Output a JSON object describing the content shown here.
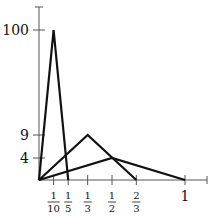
{
  "chart_data": {
    "type": "line",
    "title": "",
    "xlabel": "",
    "ylabel": "",
    "grid": false,
    "legend": "none",
    "x_ticks": [
      {
        "value": 0.1,
        "num": "1",
        "den": "10"
      },
      {
        "value": 0.2,
        "num": "1",
        "den": "5"
      },
      {
        "value": 0.3333,
        "num": "1",
        "den": "3"
      },
      {
        "value": 0.5,
        "num": "1",
        "den": "2"
      },
      {
        "value": 0.6667,
        "num": "2",
        "den": "3"
      },
      {
        "value": 1,
        "label": "1"
      }
    ],
    "y_ticks": [
      {
        "value": 4,
        "label": "4"
      },
      {
        "value": 9,
        "label": "9"
      },
      {
        "value": 100,
        "label": "100"
      }
    ],
    "series": [
      {
        "name": "spike-1/10",
        "x": [
          0,
          0.1,
          0.2
        ],
        "y": [
          0,
          100,
          0
        ]
      },
      {
        "name": "spike-1/3",
        "x": [
          0,
          0.3333,
          0.6667
        ],
        "y": [
          0,
          9,
          0
        ]
      },
      {
        "name": "spike-1/2",
        "x": [
          0,
          0.5,
          1
        ],
        "y": [
          0,
          4,
          0
        ]
      }
    ],
    "colors": {
      "axis": "#555555",
      "series": "#111111"
    }
  }
}
